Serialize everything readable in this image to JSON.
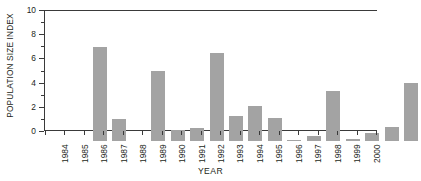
{
  "chart_data": {
    "type": "bar",
    "title": "",
    "xlabel": "YEAR",
    "ylabel": "POPULATION SIZE INDEX",
    "categories": [
      "1984",
      "1985",
      "1986",
      "1987",
      "1988",
      "1989",
      "1990",
      "1991",
      "1992",
      "1993",
      "1994",
      "1995",
      "1996",
      "1997",
      "1998",
      "1999",
      "2000"
    ],
    "values": [
      7.75,
      1.85,
      0,
      5.75,
      0.95,
      1.05,
      7.3,
      2.05,
      2.9,
      1.9,
      0.05,
      0.45,
      4.1,
      0.2,
      0.7,
      1.15,
      4.8
    ],
    "ylim": [
      0,
      10
    ],
    "y_ticks": [
      0,
      2,
      4,
      6,
      8,
      10
    ],
    "y_tick_labels": [
      "0",
      "2",
      "4",
      "6",
      "8",
      "10"
    ],
    "y_minor_ticks": [
      1,
      3,
      5,
      7,
      9
    ],
    "grid": false,
    "legend": null,
    "bar_color": "#a3a3a3",
    "axis_color": "#3a3a3a",
    "text_color": "#231f20",
    "background": "#ffffff"
  },
  "axes": {
    "y_title": "POPULATION SIZE INDEX",
    "x_title": "YEAR"
  }
}
